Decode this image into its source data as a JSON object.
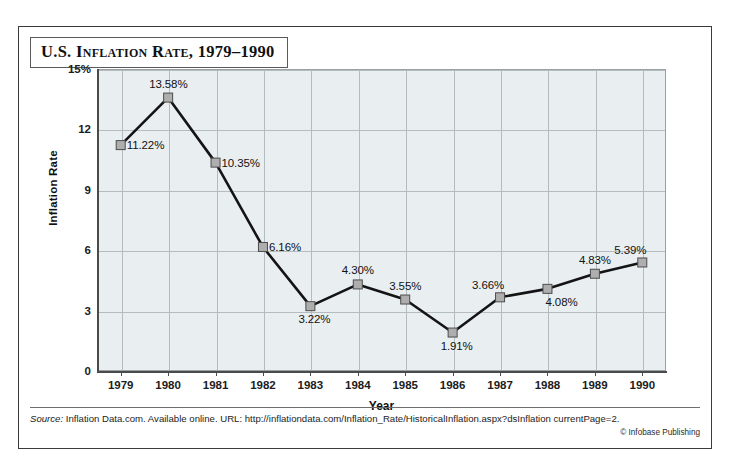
{
  "figure": {
    "title": "U.S. Inflation Rate, 1979–1990",
    "source_label": "Source:",
    "source_text": " Inflation Data.com. Available online. URL: http://inflationdata.com/Inflation_Rate/HistoricalInflation.aspx?dsInflation currentPage=2.",
    "copyright": "© Infobase Publishing"
  },
  "chart_data": {
    "type": "line",
    "title": "U.S. Inflation Rate, 1979–1990",
    "xlabel": "Year",
    "ylabel": "Inflation Rate",
    "categories": [
      "1979",
      "1980",
      "1981",
      "1982",
      "1983",
      "1984",
      "1985",
      "1986",
      "1987",
      "1988",
      "1989",
      "1990"
    ],
    "values": [
      11.22,
      13.58,
      10.35,
      6.16,
      3.22,
      4.3,
      3.55,
      1.91,
      3.66,
      4.08,
      4.83,
      5.39
    ],
    "point_labels": [
      "11.22%",
      "13.58%",
      "10.35%",
      "6.16%",
      "3.22%",
      "4.30%",
      "3.55%",
      "1.91%",
      "3.66%",
      "4.08%",
      "4.83%",
      "5.39%"
    ],
    "label_positions": [
      "right",
      "above",
      "right",
      "right",
      "below",
      "above",
      "above",
      "below",
      "above-left",
      "below-right",
      "above",
      "above-left"
    ],
    "ylim": [
      0,
      15
    ],
    "yticks": [
      0,
      3,
      6,
      9,
      12,
      15
    ],
    "ytick_labels": [
      "0",
      "3",
      "6",
      "9",
      "12",
      "15%"
    ],
    "grid": true,
    "legend": "none",
    "series_color": "#141414",
    "marker_color": "#aeaeae",
    "plot_background": "#e9eef1",
    "gridline_color": "#b5bcc0"
  }
}
